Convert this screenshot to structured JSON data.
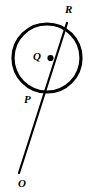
{
  "figure": {
    "kind": "geometry-diagram",
    "width": 93,
    "height": 195,
    "background_color": "#ffffff",
    "stroke_color": "#000000",
    "circle": {
      "name": "circle",
      "center_x": 47,
      "center_y": 58,
      "radius": 34,
      "stroke_width": 3.2,
      "fill": "none"
    },
    "line": {
      "name": "secant-ray",
      "x1": 67,
      "y1": 23,
      "x2": 19,
      "y2": 173,
      "stroke_width": 2.2
    },
    "center_dot": {
      "name": "center-point-marker",
      "cx": 50.5,
      "cy": 58,
      "r": 3.1
    },
    "labels": [
      {
        "id": "R",
        "text": "R",
        "x": 70,
        "y": 11
      },
      {
        "id": "Q",
        "text": "Q",
        "x": 38,
        "y": 57
      },
      {
        "id": "P",
        "text": "P",
        "x": 29,
        "y": 100
      },
      {
        "id": "O",
        "text": "O",
        "x": 23,
        "y": 184
      }
    ]
  }
}
